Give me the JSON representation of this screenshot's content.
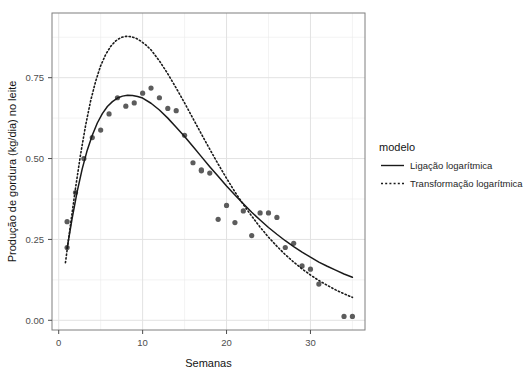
{
  "chart_data": {
    "type": "scatter",
    "title": "",
    "subtitle": "",
    "xlabel": "Semanas",
    "ylabel": "Produção de gordura (kg/dia) no leite",
    "xlim": [
      -0.8,
      36.5
    ],
    "ylim": [
      -0.03,
      0.95
    ],
    "xticks": [
      0,
      10,
      20,
      30
    ],
    "xtick_labels": [
      "0",
      "10",
      "20",
      "30"
    ],
    "yticks": [
      0.0,
      0.25,
      0.5,
      0.75
    ],
    "ytick_labels": [
      "0.00",
      "0.25",
      "0.50",
      "0.75"
    ],
    "x_minor_ticks": [
      5,
      15,
      25,
      35
    ],
    "y_minor_ticks": [
      0.125,
      0.375,
      0.625,
      0.875
    ],
    "grid": true,
    "grid_color": "#ebebeb",
    "panel_background": "#ffffff",
    "panel_border_color": "#7f7f7f",
    "legend": {
      "title": "modelo",
      "position": "right",
      "entries": [
        {
          "name": "Ligação logarítmica",
          "style": "solid",
          "color": "#1a1a1a"
        },
        {
          "name": "Transformação logarítmica",
          "style": "dotted",
          "color": "#1a1a1a"
        }
      ]
    },
    "points": {
      "name": "Observações",
      "color": "#5c5c5c",
      "radius": 2.6,
      "x": [
        1,
        1,
        2,
        3,
        4,
        5,
        6,
        7,
        8,
        9,
        10,
        11,
        12,
        13,
        14,
        15,
        16,
        17,
        17,
        18,
        19,
        20,
        21,
        22,
        23,
        24,
        25,
        26,
        27,
        28,
        29,
        30,
        31,
        34,
        35
      ],
      "y": [
        0.305,
        0.225,
        0.395,
        0.5,
        0.565,
        0.588,
        0.638,
        0.688,
        0.662,
        0.672,
        0.702,
        0.718,
        0.688,
        0.655,
        0.648,
        0.572,
        0.487,
        0.465,
        0.462,
        0.455,
        0.312,
        0.355,
        0.302,
        0.338,
        0.262,
        0.332,
        0.332,
        0.318,
        0.225,
        0.238,
        0.168,
        0.158,
        0.112,
        0.012,
        0.012
      ]
    },
    "series": [
      {
        "name": "Ligação logarítmica",
        "style": "solid",
        "color": "#1a1a1a",
        "x": [
          1.0,
          1.6,
          2.2,
          2.8,
          3.4,
          4.0,
          4.6,
          5.2,
          5.8,
          6.4,
          7.0,
          7.6,
          8.2,
          8.8,
          9.4,
          10.0,
          11.0,
          12.0,
          13.0,
          14.0,
          15.0,
          16.0,
          17.0,
          18.0,
          19.0,
          20.0,
          21.0,
          22.0,
          23.0,
          24.0,
          25.0,
          26.0,
          27.0,
          28.0,
          29.0,
          30.0,
          31.0,
          32.0,
          33.0,
          34.0,
          35.0
        ],
        "y": [
          0.222,
          0.315,
          0.398,
          0.468,
          0.526,
          0.572,
          0.61,
          0.639,
          0.661,
          0.676,
          0.687,
          0.693,
          0.696,
          0.695,
          0.692,
          0.687,
          0.671,
          0.65,
          0.625,
          0.597,
          0.568,
          0.537,
          0.506,
          0.475,
          0.445,
          0.415,
          0.387,
          0.36,
          0.334,
          0.31,
          0.287,
          0.266,
          0.246,
          0.228,
          0.211,
          0.195,
          0.18,
          0.167,
          0.155,
          0.143,
          0.133
        ]
      },
      {
        "name": "Transformação logarítmica",
        "style": "dotted",
        "color": "#1a1a1a",
        "x": [
          0.8,
          1.4,
          2.0,
          2.6,
          3.2,
          3.8,
          4.4,
          5.0,
          5.6,
          6.2,
          6.8,
          7.4,
          8.0,
          8.6,
          9.2,
          9.8,
          10.4,
          11.0,
          12.0,
          13.0,
          14.0,
          15.0,
          16.0,
          17.0,
          18.0,
          19.0,
          20.0,
          21.0,
          22.0,
          23.0,
          24.0,
          25.0,
          26.0,
          27.0,
          28.0,
          29.0,
          30.0,
          31.0,
          32.0,
          33.0,
          34.0,
          35.0
        ],
        "y": [
          0.178,
          0.295,
          0.408,
          0.512,
          0.602,
          0.678,
          0.739,
          0.787,
          0.822,
          0.847,
          0.864,
          0.874,
          0.878,
          0.877,
          0.872,
          0.863,
          0.851,
          0.836,
          0.802,
          0.762,
          0.718,
          0.672,
          0.624,
          0.576,
          0.529,
          0.483,
          0.439,
          0.397,
          0.358,
          0.322,
          0.288,
          0.257,
          0.229,
          0.203,
          0.18,
          0.159,
          0.14,
          0.123,
          0.108,
          0.094,
          0.082,
          0.071
        ]
      }
    ]
  },
  "geometry": {
    "panel": {
      "left": 52,
      "top": 13,
      "right": 365,
      "bottom": 330
    },
    "legend": {
      "title_x": 379,
      "title_y": 151,
      "row1_y": 169,
      "row2_y": 187,
      "key_x1": 381,
      "key_x2": 404,
      "label_x": 410
    }
  }
}
